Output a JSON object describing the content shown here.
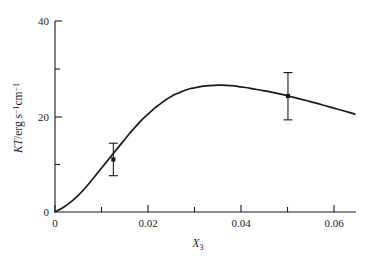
{
  "chart_data": {
    "type": "line",
    "title": "",
    "subtitle": "",
    "xlabel": "X3",
    "xlabel_base": "X",
    "xlabel_sub": "3",
    "ylabel": "KT/erg s⁻¹cm⁻¹",
    "ylabel_italic_part": "KT",
    "ylabel_rest": "/erg s",
    "ylabel_exp1": "−1",
    "ylabel_mid": "cm",
    "ylabel_exp2": "−1",
    "xlim": [
      0,
      0.0655
    ],
    "ylim": [
      0,
      41.5
    ],
    "grid": false,
    "legend": "none",
    "x_major_ticks": [
      0,
      0.02,
      0.04,
      0.06
    ],
    "x_major_tick_labels": [
      "0",
      "0.02",
      "0.04",
      "0.06"
    ],
    "x_minor_ticks": [
      0.01,
      0.03,
      0.05
    ],
    "y_major_ticks": [
      0,
      20,
      40
    ],
    "y_major_tick_labels": [
      "0",
      "20",
      "40"
    ],
    "y_minor_ticks": [
      10,
      30
    ],
    "y_labeled_ticks": [
      20,
      40
    ],
    "series": [
      {
        "name": "KT curve",
        "x": [
          0.0,
          0.001,
          0.002,
          0.003,
          0.004,
          0.005,
          0.006,
          0.007,
          0.008,
          0.009,
          0.01,
          0.011,
          0.012,
          0.013,
          0.014,
          0.015,
          0.016,
          0.017,
          0.018,
          0.019,
          0.02,
          0.021,
          0.022,
          0.023,
          0.024,
          0.025,
          0.026,
          0.027,
          0.028,
          0.029,
          0.03,
          0.031,
          0.032,
          0.033,
          0.034,
          0.035,
          0.036,
          0.037,
          0.038,
          0.039,
          0.04,
          0.042,
          0.044,
          0.046,
          0.048,
          0.05,
          0.052,
          0.054,
          0.056,
          0.058,
          0.06,
          0.062,
          0.0645
        ],
        "y": [
          0.0,
          0.5,
          1.1,
          1.8,
          2.6,
          3.5,
          4.5,
          5.6,
          6.8,
          8.0,
          9.2,
          10.4,
          11.6,
          12.8,
          14.0,
          15.2,
          16.4,
          17.5,
          18.6,
          19.6,
          20.5,
          21.4,
          22.2,
          22.9,
          23.6,
          24.2,
          24.7,
          25.1,
          25.5,
          25.8,
          26.0,
          26.2,
          26.35,
          26.45,
          26.5,
          26.55,
          26.55,
          26.5,
          26.45,
          26.35,
          26.2,
          25.9,
          25.55,
          25.2,
          24.8,
          24.35,
          23.85,
          23.35,
          22.85,
          22.3,
          21.75,
          21.2,
          20.5
        ]
      }
    ],
    "error_bars": [
      {
        "x": 0.01255,
        "y": 11.0,
        "err_low": 3.4,
        "err_high": 3.4,
        "marker": "square"
      },
      {
        "x": 0.0501,
        "y": 24.3,
        "err_low": 5.0,
        "err_high": 4.9,
        "marker": "square"
      }
    ]
  }
}
